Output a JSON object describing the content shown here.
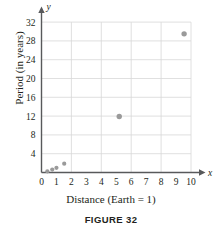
{
  "figure": {
    "caption": "FIGURE 32"
  },
  "chart_data": {
    "type": "scatter",
    "title": "",
    "xlabel": "Distance (Earth = 1)",
    "ylabel": "Period (in years)",
    "x_axis_letter": "x",
    "y_axis_letter": "y",
    "xlim": [
      0,
      10.4
    ],
    "ylim": [
      0,
      33.6
    ],
    "xticks": [
      0,
      1,
      2,
      3,
      4,
      5,
      6,
      7,
      8,
      9,
      10
    ],
    "xtick_labels": [
      "0",
      "1",
      "2",
      "3",
      "4",
      "5",
      "6",
      "7",
      "8",
      "9",
      "10"
    ],
    "yticks": [
      4,
      8,
      12,
      16,
      20,
      24,
      28,
      32
    ],
    "ytick_labels": [
      "4",
      "8",
      "12",
      "16",
      "20",
      "24",
      "28",
      "32"
    ],
    "grid": true,
    "grid_x_step": 2,
    "grid_y_step": 4,
    "legend": "none",
    "point_color": "#9a9a9a",
    "grid_color": "#d8d8d8",
    "axis_color": "#58595b",
    "points": [
      {
        "x": 0.39,
        "y": 0.24
      },
      {
        "x": 0.72,
        "y": 0.62
      },
      {
        "x": 1.0,
        "y": 1.0
      },
      {
        "x": 1.52,
        "y": 1.88
      },
      {
        "x": 5.2,
        "y": 11.9
      },
      {
        "x": 9.54,
        "y": 29.5
      }
    ]
  }
}
